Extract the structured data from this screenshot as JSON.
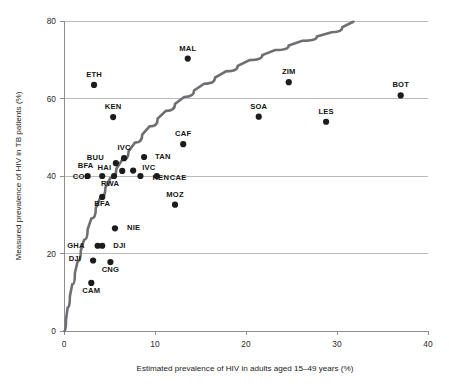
{
  "chart_data": {
    "type": "scatter",
    "title": "",
    "xlabel": "Estimated prevalence of HIV in adults aged 15–49 years (%)",
    "ylabel": "Measured prevalence of HIV in TB patients (%)",
    "xlim": [
      0,
      40
    ],
    "ylim": [
      0,
      80
    ],
    "xticks": [
      0,
      10,
      20,
      30,
      40
    ],
    "yticks": [
      0,
      20,
      40,
      60,
      80
    ],
    "xtick_labels": [
      "0",
      "10",
      "20",
      "30",
      "40"
    ],
    "ytick_labels": [
      "0",
      "20",
      "40",
      "60",
      "80"
    ],
    "grid": "horizontal",
    "legend": "none",
    "marker_color": "#1c1c1c",
    "curve_color": "#6e6f72",
    "grid_color": "#b9babd",
    "points": [
      {
        "label": "ETH",
        "x": 3.3,
        "y": 63.5,
        "label_dx": 0,
        "label_dy": -8
      },
      {
        "label": "MAL",
        "x": 13.6,
        "y": 70.3,
        "label_dx": 0,
        "label_dy": -8
      },
      {
        "label": "ZIM",
        "x": 24.7,
        "y": 64.2,
        "label_dx": 0,
        "label_dy": -8
      },
      {
        "label": "BOT",
        "x": 37.0,
        "y": 60.8,
        "label_dx": 0,
        "label_dy": -8
      },
      {
        "label": "KEN",
        "x": 5.4,
        "y": 55.2,
        "label_dx": 0,
        "label_dy": -8
      },
      {
        "label": "SOA",
        "x": 21.4,
        "y": 55.3,
        "label_dx": 0,
        "label_dy": -8
      },
      {
        "label": "LES",
        "x": 28.8,
        "y": 54.0,
        "label_dx": 0,
        "label_dy": -8
      },
      {
        "label": "CAF",
        "x": 13.1,
        "y": 48.2,
        "label_dx": 0,
        "label_dy": -8
      },
      {
        "label": "IVC",
        "x": 6.6,
        "y": 44.6,
        "label_dx": 0,
        "label_dy": -8
      },
      {
        "label": "BUU",
        "x": 5.7,
        "y": 43.3,
        "label_dx": -12,
        "label_dy": -3
      },
      {
        "label": "TAN",
        "x": 8.8,
        "y": 44.9,
        "label_dx": 11,
        "label_dy": 2
      },
      {
        "label": "HAI",
        "x": 6.4,
        "y": 41.3,
        "label_dx": -11,
        "label_dy": -1
      },
      {
        "label": "IVC",
        "x": 7.6,
        "y": 41.4,
        "label_dx": 9,
        "label_dy": -1
      },
      {
        "label": "BFA",
        "x": 2.6,
        "y": 40.0,
        "label_dx": -2,
        "label_dy": -8
      },
      {
        "label": "COD",
        "x": 4.2,
        "y": 40.0,
        "label_dx": -12,
        "label_dy": 3
      },
      {
        "label": "KEN",
        "x": 8.4,
        "y": 40.0,
        "label_dx": 12,
        "label_dy": 4
      },
      {
        "label": "CAE",
        "x": 10.2,
        "y": 40.0,
        "label_dx": 13,
        "label_dy": 4
      },
      {
        "label": "RWA",
        "x": 5.5,
        "y": 40.0,
        "label_dx": -4,
        "label_dy": 10
      },
      {
        "label": "BFA",
        "x": 4.2,
        "y": 34.6,
        "label_dx": 0,
        "label_dy": 9
      },
      {
        "label": "MOZ",
        "x": 12.2,
        "y": 32.6,
        "label_dx": 0,
        "label_dy": -8
      },
      {
        "label": "NIE",
        "x": 5.6,
        "y": 26.5,
        "label_dx": 12,
        "label_dy": 2
      },
      {
        "label": "GHA",
        "x": 3.7,
        "y": 22.0,
        "label_dx": -13,
        "label_dy": 2
      },
      {
        "label": "DJI",
        "x": 4.2,
        "y": 22.0,
        "label_dx": 11,
        "label_dy": 2
      },
      {
        "label": "DJI",
        "x": 3.2,
        "y": 18.2,
        "label_dx": -12,
        "label_dy": 1
      },
      {
        "label": "CNG",
        "x": 5.1,
        "y": 17.8,
        "label_dx": 0,
        "label_dy": 10
      },
      {
        "label": "CAM",
        "x": 3.0,
        "y": 12.4,
        "label_dx": 0,
        "label_dy": 10
      }
    ],
    "fit_curve": {
      "description": "logarithmic best-fit curve rising from origin to 80% at ~32%",
      "points": [
        [
          0.05,
          0.0
        ],
        [
          0.4,
          6.0
        ],
        [
          0.9,
          12.0
        ],
        [
          1.5,
          18.0
        ],
        [
          2.2,
          23.5
        ],
        [
          3.0,
          29.0
        ],
        [
          4.0,
          34.5
        ],
        [
          5.1,
          39.5
        ],
        [
          6.4,
          44.2
        ],
        [
          7.8,
          48.6
        ],
        [
          9.4,
          52.8
        ],
        [
          11.2,
          56.8
        ],
        [
          13.2,
          60.4
        ],
        [
          15.4,
          63.8
        ],
        [
          17.8,
          67.0
        ],
        [
          20.4,
          69.9
        ],
        [
          23.2,
          72.5
        ],
        [
          26.2,
          74.9
        ],
        [
          29.4,
          77.1
        ],
        [
          31.8,
          79.8
        ]
      ]
    }
  }
}
